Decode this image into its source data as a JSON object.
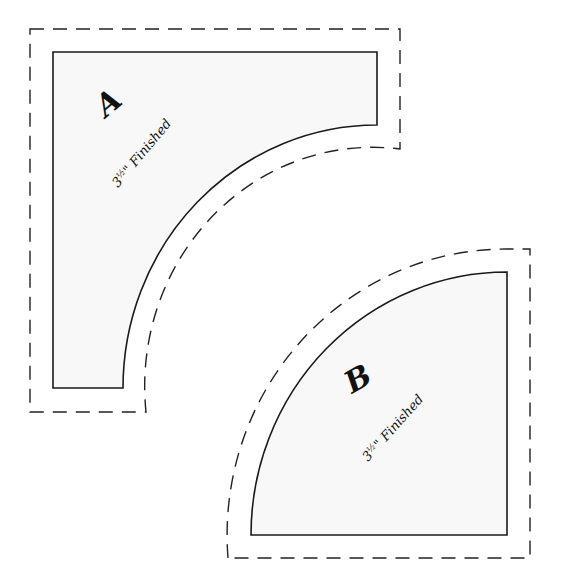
{
  "diagram": {
    "type": "quilt-template",
    "pieces": [
      {
        "id": "A",
        "letter": "A",
        "size_label": "3½\" Finished",
        "size_number": "3",
        "size_fraction": "½",
        "size_suffix": "\" Finished"
      },
      {
        "id": "B",
        "letter": "B",
        "size_label": "3½\" Finished",
        "size_number": "3",
        "size_fraction": "½",
        "size_suffix": "\" Finished"
      }
    ],
    "line_legend": {
      "solid": "finished sewing line",
      "dashed": "cutting line (seam allowance)"
    },
    "colors": {
      "fill": "#f8f8f8",
      "stroke": "#1a1a1a",
      "background": "#ffffff"
    }
  }
}
